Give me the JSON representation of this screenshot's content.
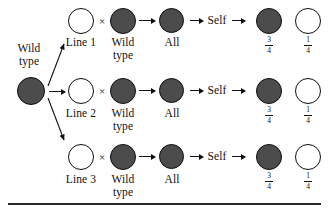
{
  "figure": {
    "type": "genetics-cross-diagram",
    "source": {
      "label_line1": "Wild",
      "label_line2": "type",
      "allele": "wild-type"
    },
    "operator": "×",
    "self_label": "Self",
    "rows": [
      {
        "mutant_label": "Line 1",
        "partner_line1": "Wild",
        "partner_line2": "type",
        "f1_label": "All",
        "f2": [
          {
            "phenotype": "wild-type",
            "numerator": "3",
            "denominator": "4"
          },
          {
            "phenotype": "mutant",
            "numerator": "1",
            "denominator": "4"
          }
        ]
      },
      {
        "mutant_label": "Line 2",
        "partner_line1": "Wild",
        "partner_line2": "type",
        "f1_label": "All",
        "f2": [
          {
            "phenotype": "wild-type",
            "numerator": "3",
            "denominator": "4"
          },
          {
            "phenotype": "mutant",
            "numerator": "1",
            "denominator": "4"
          }
        ]
      },
      {
        "mutant_label": "Line 3",
        "partner_line1": "Wild",
        "partner_line2": "type",
        "f1_label": "All",
        "f2": [
          {
            "phenotype": "wild-type",
            "numerator": "3",
            "denominator": "4"
          },
          {
            "phenotype": "mutant",
            "numerator": "1",
            "denominator": "4"
          }
        ]
      }
    ],
    "colors": {
      "wild_type_fill": "#4c4c4c",
      "mutant_fill": "#ffffff",
      "outline": "#0d0d0d",
      "rule": "#2a2a2a"
    }
  }
}
